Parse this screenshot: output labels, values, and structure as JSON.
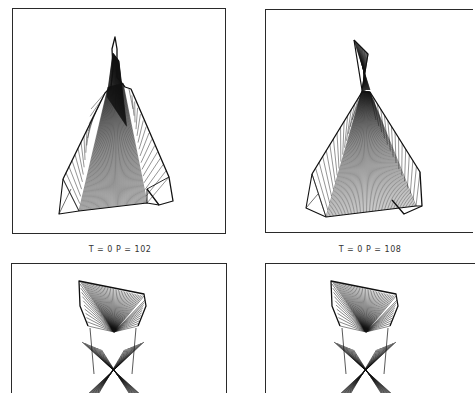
{
  "figure": {
    "panels": [
      {
        "id": "top-left",
        "caption": "T = 0   P = 102",
        "shape": "wireframe-flared-spike"
      },
      {
        "id": "top-right",
        "caption": "T = 0   P = 108",
        "shape": "wireframe-twisted-bowtie"
      },
      {
        "id": "bottom-left",
        "caption": "",
        "shape": "wireframe-inverted-fan"
      },
      {
        "id": "bottom-right",
        "caption": "",
        "shape": "wireframe-inverted-fan"
      }
    ]
  }
}
